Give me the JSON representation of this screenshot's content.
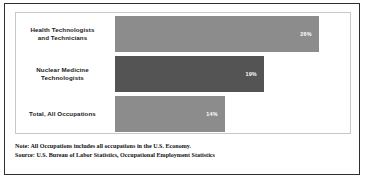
{
  "chart_data": {
    "type": "bar",
    "orientation": "horizontal",
    "title": "",
    "xlabel": "",
    "ylabel": "",
    "categories": [
      "Health Technologists\nand Technicians",
      "Nuclear Medicine\nTechnologists",
      "Total, All Occupations"
    ],
    "values": [
      26,
      19,
      14
    ],
    "value_labels": [
      "26%",
      "19%",
      "14%"
    ],
    "xlim": [
      0,
      30
    ],
    "grid": false,
    "legend": null,
    "bar_colors": [
      "#8c8c8c",
      "#545454",
      "#8c8c8c"
    ]
  },
  "categories": [
    {
      "label_line1": "Health Technologists",
      "label_line2": "and Technicians",
      "value_label": "26%",
      "value": 26,
      "color": "#8c8c8c"
    },
    {
      "label_line1": "Nuclear Medicine",
      "label_line2": "Technologists",
      "value_label": "19%",
      "value": 19,
      "color": "#545454"
    },
    {
      "label_line1": "Total, All Occupations",
      "label_line2": "",
      "value_label": "14%",
      "value": 14,
      "color": "#8c8c8c"
    }
  ],
  "footnote": {
    "note": "Note: All Occupations includes all occupations in the U.S. Economy.",
    "source": "Source: U.S. Bureau of Labor Statistics, Occupational Employment Statistics"
  },
  "colors": {
    "frame": "#2e2e2e",
    "panel_border": "#c8c8c8",
    "bar_light": "#8c8c8c",
    "bar_dark": "#545454",
    "text": "#1a1a1a",
    "value_text": "#ffffff",
    "background": "#ffffff"
  }
}
